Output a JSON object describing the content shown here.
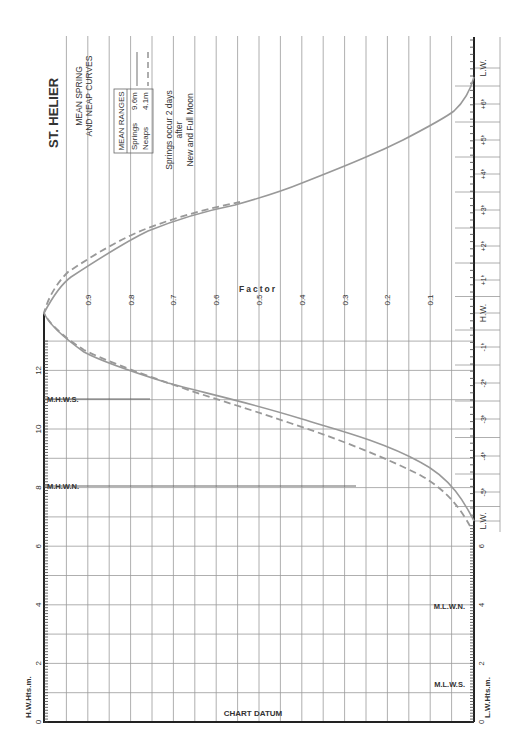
{
  "chart_data": {
    "type": "line",
    "title": "ST. HELIER",
    "subtitle_lines": [
      "MEAN SPRING",
      "AND NEAP CURVES"
    ],
    "legend": {
      "box_title": "MEAN RANGES",
      "entries": [
        {
          "label": "Springs",
          "value": "9.6m",
          "style": "solid"
        },
        {
          "label": "Neaps",
          "value": "4.1m",
          "style": "dashed"
        }
      ]
    },
    "note_lines": [
      "Springs occur 2 days",
      "after",
      "New and Full Moon"
    ],
    "factor_axis": {
      "label": "Factor",
      "ticks": [
        "0.9",
        "0.8",
        "0.7",
        "0.6",
        "0.5",
        "0.4",
        "0.3",
        "0.2",
        "0.1"
      ]
    },
    "time_axis": {
      "ticks": [
        "L.W.",
        "+6h",
        "+5h",
        "+4h",
        "+3h",
        "+2h",
        "+1h",
        "H.W.",
        "-1h",
        "-2h",
        "-3h",
        "-4h",
        "-5h",
        "L.W."
      ]
    },
    "hw_height_axis": {
      "label": "H.W.Hts.m.",
      "ticks": [
        "0",
        "2",
        "4",
        "6",
        "8",
        "10",
        "12"
      ],
      "markers": [
        {
          "label": "M.H.W.S.",
          "value": 11
        },
        {
          "label": "M.H.W.N.",
          "value": 8.1
        }
      ]
    },
    "lw_height_axis": {
      "label": "L.W.Hts.m.",
      "ticks": [
        "0",
        "2",
        "4",
        "6"
      ],
      "markers": [
        {
          "label": "M.L.W.N.",
          "value": 4.0
        },
        {
          "label": "M.L.W.S.",
          "value": 1.4
        }
      ]
    },
    "datum_label": "CHART DATUM",
    "series": [
      {
        "name": "Springs",
        "x_hours": [
          -6,
          -5,
          -4,
          -3,
          -2,
          -1,
          0,
          1,
          2,
          3,
          4,
          5,
          6
        ],
        "factor": [
          0.0,
          0.06,
          0.2,
          0.4,
          0.7,
          0.9,
          1.0,
          0.94,
          0.78,
          0.57,
          0.38,
          0.16,
          0.0
        ]
      },
      {
        "name": "Neaps",
        "x_hours": [
          -6,
          -5,
          -4,
          -3,
          -2,
          -1,
          0,
          1,
          2,
          3,
          4,
          5,
          6
        ],
        "factor": [
          0.0,
          0.04,
          0.18,
          0.37,
          0.68,
          0.9,
          1.0,
          0.96,
          0.8,
          0.58,
          0.38,
          0.16,
          0.0
        ]
      }
    ]
  }
}
